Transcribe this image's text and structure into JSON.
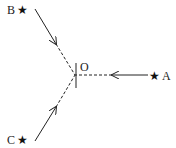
{
  "diagram": {
    "center": {
      "label": "O",
      "x": 75,
      "y": 75
    },
    "points": [
      {
        "id": "A",
        "label": "A",
        "star": "★",
        "x": 156,
        "y": 75
      },
      {
        "id": "B",
        "label": "B",
        "star": "★",
        "x": 22,
        "y": 10
      },
      {
        "id": "C",
        "label": "C",
        "star": "★",
        "x": 22,
        "y": 140
      }
    ],
    "colors": {
      "line": "#222222",
      "background": "#ffffff"
    }
  }
}
